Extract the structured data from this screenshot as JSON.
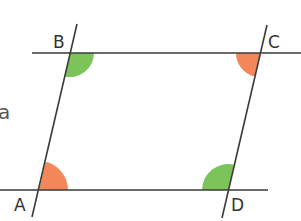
{
  "diagram": {
    "type": "parallelogram",
    "stray_text": "a",
    "vertices": [
      {
        "label": "A",
        "x": 39,
        "y": 190
      },
      {
        "label": "B",
        "x": 70,
        "y": 53
      },
      {
        "label": "C",
        "x": 260,
        "y": 53
      },
      {
        "label": "D",
        "x": 228,
        "y": 190
      }
    ],
    "angle_marks": [
      {
        "vertex": "A",
        "color": "#f4875a",
        "meaning": "obtuse-interior"
      },
      {
        "vertex": "B",
        "color": "#7cc35a",
        "meaning": "acute-interior"
      },
      {
        "vertex": "C",
        "color": "#f4875a",
        "meaning": "obtuse-interior"
      },
      {
        "vertex": "D",
        "color": "#7cc35a",
        "meaning": "acute-interior"
      }
    ],
    "colors": {
      "line": "#3a3a3a",
      "obtuse": "#f4875a",
      "acute": "#7cc35a",
      "label": "#333333"
    }
  }
}
